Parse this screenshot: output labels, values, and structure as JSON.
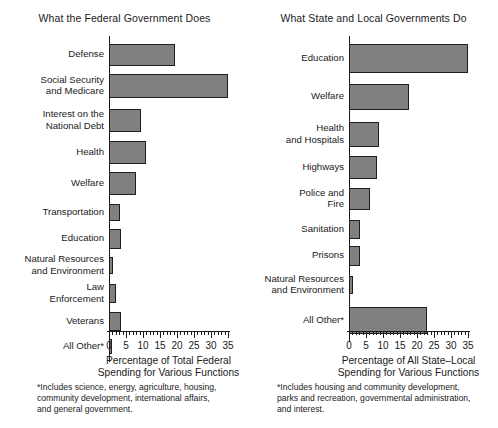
{
  "chart_data": [
    {
      "type": "bar",
      "orientation": "horizontal",
      "title": "What the Federal Government Does",
      "xlabel": "Percentage of Total Federal\nSpending for Various Functions",
      "ylabel": "",
      "xlim": [
        0,
        35
      ],
      "xticks": [
        0,
        5,
        10,
        15,
        20,
        25,
        30,
        35
      ],
      "xtick_labels": [
        "0",
        "5",
        "10",
        "15",
        "20",
        "25",
        "30",
        "35"
      ],
      "minor_tick_step": 1,
      "grid": false,
      "legend": "none",
      "bar_color": "#808080",
      "bar_edge_color": "#1f1f1f",
      "categories": [
        "Defense",
        "Social Security\nand Medicare",
        "Interest on the\nNational Debt",
        "Health",
        "Welfare",
        "Transportation",
        "Education",
        "Natural Resources\nand Environment",
        "Law\nEnforcement",
        "Veterans",
        "All Other*"
      ],
      "values": [
        19.5,
        35,
        9.5,
        11,
        8,
        3.3,
        3.6,
        1.3,
        2.1,
        3.4,
        0.8
      ],
      "footnote": "*Includes science, energy, agriculture, housing,\ncommunity development, international affairs,\nand general government."
    },
    {
      "type": "bar",
      "orientation": "horizontal",
      "title": "What State and Local Governments Do",
      "xlabel": "Percentage of All State–Local\nSpending for Various Functions",
      "ylabel": "",
      "xlim": [
        0,
        35
      ],
      "xticks": [
        0,
        5,
        10,
        15,
        20,
        25,
        30,
        35
      ],
      "xtick_labels": [
        "0",
        "5",
        "10",
        "15",
        "20",
        "25",
        "30",
        "35"
      ],
      "minor_tick_step": 1,
      "grid": false,
      "legend": "none",
      "bar_color": "#808080",
      "bar_edge_color": "#1f1f1f",
      "categories": [
        "Education",
        "Welfare",
        "Health\nand Hospitals",
        "Highways",
        "Police and\nFire",
        "Sanitation",
        "Prisons",
        "Natural Resources\nand Environment",
        "All Other*"
      ],
      "values": [
        35,
        17.6,
        8.7,
        8.2,
        6.2,
        3.2,
        3.3,
        1.1,
        22.8
      ],
      "footnote": "*Includes housing and community development,\nparks and recreation, governmental administration,\nand  interest."
    }
  ],
  "panels": [
    {
      "title": "What the Federal Government Does",
      "axis_title": "Percentage of Total Federal\nSpending for Various Functions",
      "footnote": "*Includes science, energy, agriculture, housing,\ncommunity development, international affairs,\nand general government.",
      "tick_labels": [
        "0",
        "5",
        "10",
        "15",
        "20",
        "25",
        "30",
        "35"
      ],
      "rows": [
        {
          "label": "Defense",
          "value": 19.5
        },
        {
          "label": "Social Security\nand Medicare",
          "value": 35
        },
        {
          "label": "Interest on the\nNational Debt",
          "value": 9.5
        },
        {
          "label": "Health",
          "value": 11
        },
        {
          "label": "Welfare",
          "value": 8
        },
        {
          "label": "Transportation",
          "value": 3.3
        },
        {
          "label": "Education",
          "value": 3.6
        },
        {
          "label": "Natural Resources\nand Environment",
          "value": 1.3
        },
        {
          "label": "Law\nEnforcement",
          "value": 2.1
        },
        {
          "label": "Veterans",
          "value": 3.4
        },
        {
          "label": "All Other*",
          "value": 0.8
        }
      ]
    },
    {
      "title": "What State and Local Governments Do",
      "axis_title": "Percentage of All State–Local\nSpending for Various Functions",
      "footnote": "*Includes housing and community development,\nparks and recreation, governmental administration,\nand  interest.",
      "tick_labels": [
        "0",
        "5",
        "10",
        "15",
        "20",
        "25",
        "30",
        "35"
      ],
      "rows": [
        {
          "label": "Education",
          "value": 35
        },
        {
          "label": "Welfare",
          "value": 17.6
        },
        {
          "label": "Health\nand Hospitals",
          "value": 8.7
        },
        {
          "label": "Highways",
          "value": 8.2
        },
        {
          "label": "Police and\nFire",
          "value": 6.2
        },
        {
          "label": "Sanitation",
          "value": 3.2
        },
        {
          "label": "Prisons",
          "value": 3.3
        },
        {
          "label": "Natural Resources\nand Environment",
          "value": 1.1
        },
        {
          "label": "All Other*",
          "value": 22.8
        }
      ]
    }
  ]
}
